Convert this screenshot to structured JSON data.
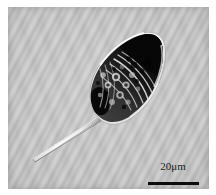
{
  "figure": {
    "kind": "light-micrograph",
    "caption_text": "",
    "plate": {
      "background_color": "#b8b8b8",
      "border_color": "#ffffff"
    }
  },
  "specimen": {
    "name": "protist-cell",
    "description": "kite-shaped single-celled organism with long posterior spine",
    "body_fill_color": "#2a2a2a",
    "body_outline_color": "#f2f2f2",
    "spine_color": "#e8e8e8",
    "granule_color": "#111111",
    "striation_color": "#efefef"
  },
  "scale_bar": {
    "label": "20μm",
    "value": 20,
    "unit": "μm",
    "bar_color": "#0c0c0c",
    "text_color": "#181818",
    "bar_length_px": 51
  }
}
